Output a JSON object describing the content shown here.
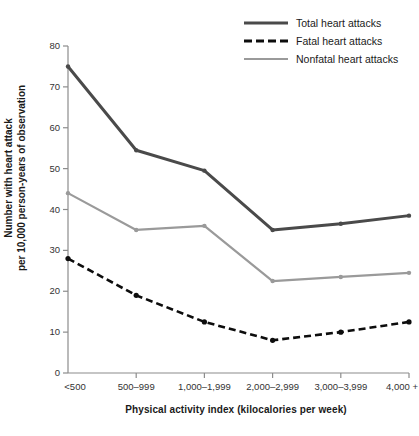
{
  "chart_data": {
    "type": "line",
    "title": "",
    "xlabel": "Physical activity index (kilocalories per week)",
    "ylabel": "Number with heart attack per 10,000 person-years of observation",
    "ylabel_line1": "Number with heart attack",
    "ylabel_line2": "per 10,000 person-years of observation",
    "categories": [
      "<500",
      "500–999",
      "1,000–1,999",
      "2,000–2,999",
      "3,000–3,999",
      "4,000 +"
    ],
    "yticks": [
      0,
      10,
      20,
      30,
      40,
      50,
      60,
      70,
      80
    ],
    "ylim": [
      0,
      80
    ],
    "grid": false,
    "legend_position": "top-right",
    "series": [
      {
        "name": "Total heart attacks",
        "values": [
          75,
          54.5,
          49.5,
          35,
          36.5,
          38.5
        ],
        "color": "#4a4a4a",
        "style": "solid",
        "width": 3
      },
      {
        "name": "Fatal heart attacks",
        "values": [
          28,
          19,
          12.5,
          8,
          10,
          12.5
        ],
        "color": "#0d0d0d",
        "style": "dashed",
        "width": 2.6
      },
      {
        "name": "Nonfatal heart attacks",
        "values": [
          44,
          35,
          36,
          22.5,
          23.5,
          24.5
        ],
        "color": "#9a9a9a",
        "style": "solid",
        "width": 2.2
      }
    ]
  },
  "legend": {
    "items": [
      {
        "label": "Total heart attacks",
        "swatch": "solid-dark-line-icon"
      },
      {
        "label": "Fatal heart attacks",
        "swatch": "dashed-black-line-icon"
      },
      {
        "label": "Nonfatal heart attacks",
        "swatch": "solid-gray-line-icon"
      }
    ]
  },
  "axes": {
    "x_title": "Physical activity index (kilocalories per week)",
    "y_title_line1": "Number with heart attack",
    "y_title_line2": "per 10,000 person-years of observation",
    "y_tick_labels": [
      "80",
      "70",
      "60",
      "50",
      "40",
      "30",
      "20",
      "10",
      "0"
    ],
    "x_tick_labels": [
      "<500",
      "500–999",
      "1,000–1,999",
      "2,000–2,999",
      "3,000–3,999",
      "4,000 +"
    ]
  },
  "colors": {
    "total": "#4a4a4a",
    "fatal": "#0d0d0d",
    "nonfatal": "#9a9a9a",
    "axis": "#8c8c8c",
    "background": "#ffffff"
  }
}
